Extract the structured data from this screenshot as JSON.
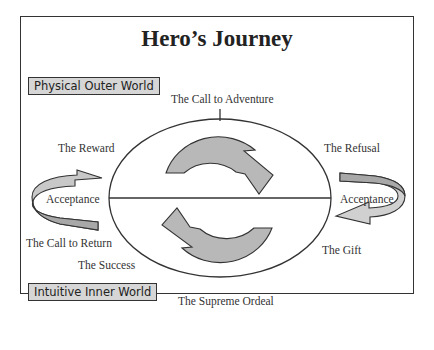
{
  "title": "Hero’s Journey",
  "worlds": {
    "outer": "Physical Outer World",
    "inner": "Intuitive Inner World"
  },
  "stages": {
    "call_to_adventure": "The Call to Adventure",
    "refusal": "The Refusal",
    "acceptance_right": "Acceptance",
    "gift": "The Gift",
    "supreme_ordeal": "The Supreme Ordeal",
    "success": "The Success",
    "call_to_return": "The Call to Return",
    "acceptance_left": "Acceptance",
    "reward": "The Reward"
  },
  "colors": {
    "arrow_fill": "#b8b8b8",
    "arrow_light": "#d9d9d9",
    "stroke": "#333333",
    "box_fill": "#d6d6d6"
  }
}
